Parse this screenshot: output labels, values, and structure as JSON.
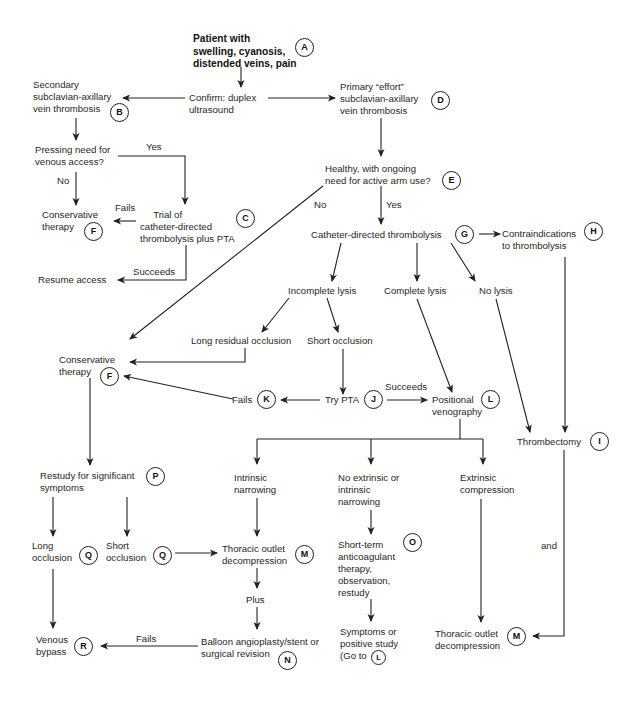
{
  "diagram": {
    "type": "flowchart",
    "topic": "Management of subclavian-axillary vein thrombosis",
    "nodes": {
      "A": {
        "text": "Patient with\nswelling, cyanosis,\ndistended veins, pain",
        "badge": "A"
      },
      "confirm": {
        "text": "Confirm: duplex\nultrasound"
      },
      "B": {
        "text": "Secondary\nsubclavian-axillary\nvein thrombosis",
        "badge": "B"
      },
      "D": {
        "text": "Primary “effort”\nsubclavian-axillary\nvein thrombosis",
        "badge": "D"
      },
      "pressing": {
        "text": "Pressing need for\nvenous access?"
      },
      "F1": {
        "text": "Conservative\ntherapy",
        "badge": "F"
      },
      "C": {
        "text": "     Trial of\ncatheter-directed\nthrombolysis plus PTA",
        "badge": "C"
      },
      "resume": {
        "text": "Resume access"
      },
      "E": {
        "text": "Healthy, with ongoing\nneed for active arm use?",
        "badge": "E"
      },
      "G": {
        "text": "Catheter-directed thrombolysis",
        "badge": "G"
      },
      "H": {
        "text": "Contraindications\nto thrombolysis",
        "badge": "H"
      },
      "incomplete": {
        "text": "Incomplete lysis"
      },
      "complete": {
        "text": "Complete lysis"
      },
      "nolysis": {
        "text": "No lysis"
      },
      "longres": {
        "text": "Long residual occlusion"
      },
      "shortocc": {
        "text": "Short occlusion"
      },
      "F2": {
        "text": "Conservative\ntherapy",
        "badge": "F"
      },
      "K": {
        "text": "Fails",
        "badge": "K"
      },
      "J": {
        "text": "Try PTA",
        "badge": "J"
      },
      "L": {
        "text": "Positional\nvenography",
        "badge": "L"
      },
      "I": {
        "text": "Thrombectomy",
        "badge": "I"
      },
      "P": {
        "text": "Restudy for significant\nsymptoms",
        "badge": "P"
      },
      "intrinsic": {
        "text": "Intrinsic\nnarrowing"
      },
      "noext": {
        "text": "No extrinsic or\nintrinsic\nnarrowing"
      },
      "extrinsic": {
        "text": "Extrinsic\ncompression"
      },
      "Q1": {
        "text": "Long\nocclusion",
        "badge": "Q"
      },
      "Q2": {
        "text": "Short\nocclusion",
        "badge": "Q"
      },
      "M1": {
        "text": "Thoracic outlet\ndecompression",
        "badge": "M"
      },
      "O": {
        "text": "Short-term\nanticoagulant\ntherapy,\nobservation,\nrestudy",
        "badge": "O"
      },
      "plus": {
        "text": "Plus"
      },
      "R": {
        "text": "Venous\nbypass",
        "badge": "R"
      },
      "N": {
        "text": "Balloon angioplasty/stent or\nsurgical revision",
        "badge": "N"
      },
      "symptoms": {
        "text": "Symptoms or\npositive study\n(Go to  )",
        "badge": "L"
      },
      "M2": {
        "text": "Thoracic outlet\ndecompression",
        "badge": "M"
      }
    },
    "edge_labels": {
      "yes1": "Yes",
      "no1": "No",
      "fails1": "Fails",
      "succeeds1": "Succeeds",
      "no2": "No",
      "yes2": "Yes",
      "succeeds2": "Succeeds",
      "and": "and",
      "fails2": "Fails"
    }
  }
}
